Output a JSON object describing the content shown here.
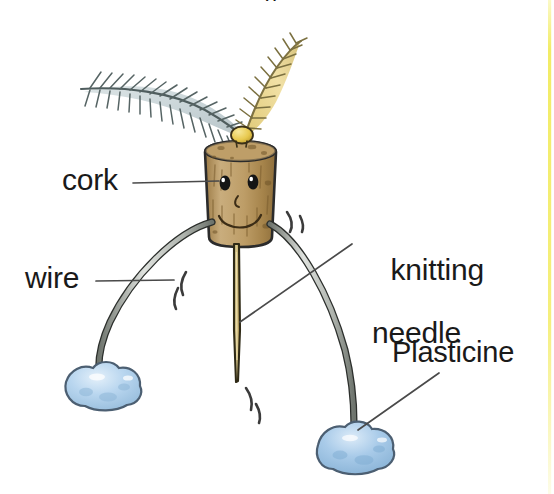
{
  "image": {
    "title": "Cork and wire balancing toy",
    "width": 554,
    "height": 494,
    "background_color": "#ffffff",
    "top_cropped_caption_fragment": "g ,"
  },
  "labels": {
    "cork": "cork",
    "wire": "wire",
    "knitting_needle_line1": "knitting",
    "knitting_needle_line2": "needle",
    "plasticine": "Plasticine"
  },
  "colors": {
    "ink": "#1a1a1a",
    "cork_body": "#b08d55",
    "cork_body_light": "#cdb183",
    "cork_shadow": "#8a6b3a",
    "needle": "#cbb87e",
    "needle_shadow": "#9d8a4f",
    "wire": "#b9bdb7",
    "wire_dark": "#6e746d",
    "plasticine": "#aacdea",
    "plasticine_light": "#d6e7f6",
    "plasticine_edge": "#5f748a",
    "feather_grey": "#b7c4c6",
    "feather_grey_dark": "#5d6b6b",
    "feather_yellow": "#e3c767",
    "feather_yellow_dark": "#7e7243",
    "bead_yellow": "#e8c94f",
    "leader_line": "#555555",
    "right_rule": "#f3ef7a"
  },
  "parts": [
    {
      "name": "cork",
      "label": "cork",
      "description": "Brown cylindrical cork body with a drawn smiling face (two eyes, nose, mouth)"
    },
    {
      "name": "wire",
      "label": "wire",
      "description": "Two curved wires forming legs, pushed into the sides of the cork"
    },
    {
      "name": "knitting-needle",
      "label": "knitting needle",
      "description": "Tan knitting needle pushed down through the bottom of the cork, pointing down"
    },
    {
      "name": "plasticine",
      "label": "Plasticine",
      "description": "Two pale blue Plasticine blobs weighting the ends of the wires"
    },
    {
      "name": "feathers",
      "label": "",
      "description": "A grey-blue feather curving to the left and a yellow feather angled up to the right, stuck in the top of the cork under a small yellow bead"
    }
  ],
  "annotations": {
    "motion_lines_right_count": 2,
    "motion_lines_left_count": 2,
    "motion_lines_bottom_count": 2
  }
}
